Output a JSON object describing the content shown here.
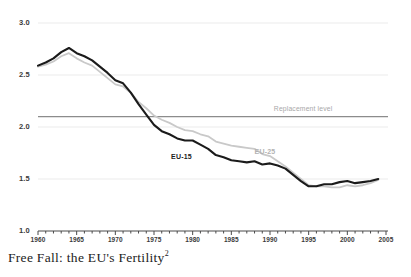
{
  "caption": {
    "text": "Free Fall: the EU's Fertility",
    "footnote_marker": "2"
  },
  "chart_data": {
    "type": "line",
    "title": "Free Fall: the EU's Fertility",
    "xlabel": "",
    "ylabel": "",
    "xlim": [
      1960,
      2005
    ],
    "ylim": [
      1.0,
      3.0
    ],
    "grid": true,
    "legend_position": "inline-annotations",
    "y_ticks": [
      "3.0",
      "2.5",
      "2.0",
      "1.5",
      "1.0"
    ],
    "y_tick_values": [
      3.0,
      2.5,
      2.0,
      1.5,
      1.0
    ],
    "x_ticks": [
      "1960",
      "1965",
      "1970",
      "1975",
      "1980",
      "1985",
      "1990",
      "1995",
      "2000",
      "2005"
    ],
    "x_tick_values": [
      1960,
      1965,
      1970,
      1975,
      1980,
      1985,
      1990,
      1995,
      2000,
      2005
    ],
    "x_minor_tick_step": 1,
    "colors": {
      "eu15": "#1b1b1b",
      "eu25": "#c9c9c9",
      "replacement": "#8c8c8c",
      "gridline": "#ebebeb",
      "axis": "#4a4a4a",
      "text": "#3a3a3a"
    },
    "annotations": [
      {
        "name": "replacement-level",
        "label": "Replacement level",
        "value": 2.1
      },
      {
        "name": "eu15-label",
        "label": "EU-15"
      },
      {
        "name": "eu25-label",
        "label": "EU-25"
      }
    ],
    "x": [
      1960,
      1961,
      1962,
      1963,
      1964,
      1965,
      1966,
      1967,
      1968,
      1969,
      1970,
      1971,
      1972,
      1973,
      1974,
      1975,
      1976,
      1977,
      1978,
      1979,
      1980,
      1981,
      1982,
      1983,
      1984,
      1985,
      1986,
      1987,
      1988,
      1989,
      1990,
      1991,
      1992,
      1993,
      1994,
      1995,
      1996,
      1997,
      1998,
      1999,
      2000,
      2001,
      2002,
      2003,
      2004
    ],
    "series": [
      {
        "name": "EU-15",
        "color": "#1b1b1b",
        "values": [
          2.59,
          2.62,
          2.66,
          2.72,
          2.76,
          2.71,
          2.68,
          2.64,
          2.58,
          2.52,
          2.45,
          2.42,
          2.33,
          2.22,
          2.12,
          2.02,
          1.96,
          1.93,
          1.89,
          1.87,
          1.87,
          1.83,
          1.79,
          1.73,
          1.71,
          1.68,
          1.67,
          1.66,
          1.67,
          1.64,
          1.65,
          1.63,
          1.6,
          1.54,
          1.48,
          1.43,
          1.43,
          1.45,
          1.45,
          1.47,
          1.48,
          1.46,
          1.47,
          1.48,
          1.5
        ]
      },
      {
        "name": "EU-25",
        "color": "#c9c9c9",
        "values": [
          2.58,
          2.6,
          2.63,
          2.68,
          2.71,
          2.66,
          2.62,
          2.59,
          2.53,
          2.47,
          2.41,
          2.39,
          2.33,
          2.24,
          2.18,
          2.11,
          2.07,
          2.04,
          2.0,
          1.97,
          1.96,
          1.93,
          1.91,
          1.86,
          1.84,
          1.82,
          1.81,
          1.8,
          1.79,
          1.74,
          1.72,
          1.67,
          1.62,
          1.56,
          1.5,
          1.44,
          1.43,
          1.43,
          1.42,
          1.42,
          1.44,
          1.43,
          1.44,
          1.46,
          1.49
        ]
      }
    ],
    "reference_line": {
      "name": "Replacement level",
      "value": 2.1,
      "color": "#8c8c8c"
    }
  }
}
